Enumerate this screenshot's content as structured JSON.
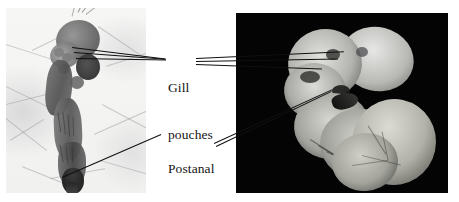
{
  "figure": {
    "type": "comparative-embryology-micrographs",
    "background_color": "#ffffff",
    "width": 459,
    "height": 202
  },
  "panels": [
    {
      "id": "left",
      "name": "left-micrograph",
      "description": "pale bright-field micrograph of a curved embryo on a light background with fine branching filaments",
      "background_color": "#f3f3f3",
      "x": 6,
      "y": 8,
      "width": 140,
      "height": 185
    },
    {
      "id": "right",
      "name": "right-micrograph",
      "description": "dark-field micrograph of a C-shaped embryo with yolk sac on a black background",
      "background_color": "#050505",
      "x": 236,
      "y": 13,
      "width": 212,
      "height": 180
    }
  ],
  "labels": {
    "gill": {
      "line1": "Gill",
      "line2": "pouches",
      "text": "Gill pouches",
      "color": "#141414"
    },
    "postanal": {
      "line1": "Postanal",
      "line2": "tail",
      "text": "Postanal tail",
      "color": "#141414"
    }
  },
  "leaders": {
    "gill_left_count": 3,
    "gill_right_count": 3,
    "postanal_left_count": 1,
    "postanal_right_count": 2,
    "color": "#101010"
  }
}
